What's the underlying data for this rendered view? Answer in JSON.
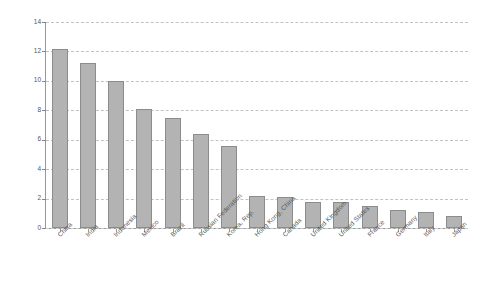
{
  "chart_data": {
    "type": "bar",
    "title": "",
    "xlabel": "",
    "ylabel": "% Growth Compounded",
    "ylim": [
      0,
      14
    ],
    "yticks": [
      0,
      2,
      4,
      6,
      8,
      10,
      12,
      14
    ],
    "grid": true,
    "legend": false,
    "orientation": "vertical",
    "bar_color": "#b3b3b3",
    "bar_edge_color": "#8c8c8c",
    "categories": [
      "China",
      "India",
      "Indonesia",
      "Mexico",
      "Brazil",
      "Russian Federation",
      "Korea, Rep.",
      "Hong Kong, China",
      "Canada",
      "United Kingdom",
      "United States",
      "France",
      "Germany",
      "Italy",
      "Japan"
    ],
    "values": [
      12.2,
      11.2,
      10.0,
      8.1,
      7.5,
      6.4,
      5.6,
      2.2,
      2.1,
      1.8,
      1.75,
      1.5,
      1.25,
      1.1,
      0.85
    ]
  }
}
